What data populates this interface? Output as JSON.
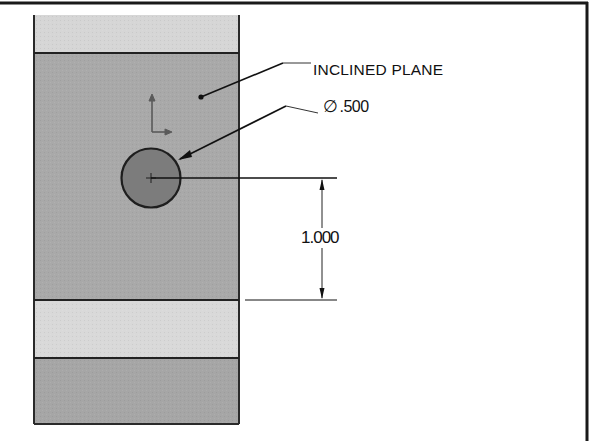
{
  "drawing": {
    "type": "engineering-drawing-view",
    "callouts": {
      "inclined_plane": "INCLINED PLANE",
      "hole_diameter_symbol": "∅",
      "hole_diameter_value": ".500",
      "hole_diameter_full": "∅.500"
    },
    "dimensions": {
      "hole_to_edge": "1.000"
    },
    "icons": {
      "origin_triad": "coordinate-axes-icon"
    },
    "colors": {
      "border": "#1a1a1a",
      "face_dark": "#a9a9a9",
      "face_light": "#d6d6d6",
      "hole_fill": "#7c7c7c",
      "line": "#222222",
      "background": "#ffffff"
    }
  }
}
